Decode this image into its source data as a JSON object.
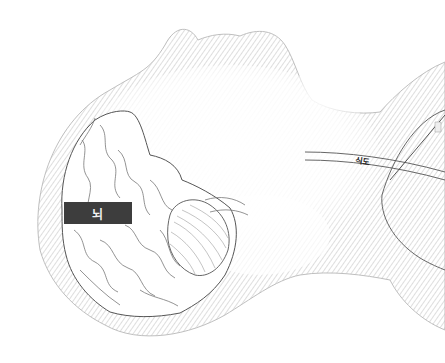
{
  "illustration": {
    "subject": "head and neck side view, lying back",
    "colors": {
      "background": "#ffffff",
      "outline": "#555555",
      "shading": "#d9d9d9",
      "label_box": "#3d3d3d",
      "label_box_text": "#f2f2f2"
    },
    "labels": {
      "brain": "뇌",
      "esophagus": "식도"
    }
  }
}
